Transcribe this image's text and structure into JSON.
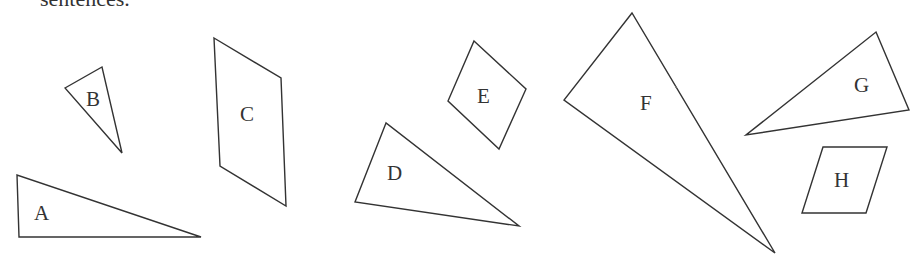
{
  "caption": "sentences.",
  "colors": {
    "stroke": "#333333",
    "text": "#333333",
    "background": "#ffffff"
  },
  "shapes": [
    {
      "id": "A",
      "label": "A",
      "kind": "triangle",
      "points": "17,175 19,237 201,237",
      "label_pos": [
        34,
        220
      ]
    },
    {
      "id": "B",
      "label": "B",
      "kind": "triangle",
      "points": "65,88 102,67 122,153",
      "label_pos": [
        86,
        106
      ]
    },
    {
      "id": "C",
      "label": "C",
      "kind": "parallelogram",
      "points": "214,38 281,78 286,206 220,166",
      "label_pos": [
        240,
        121
      ]
    },
    {
      "id": "D",
      "label": "D",
      "kind": "triangle",
      "points": "386,123 355,202 519,226",
      "label_pos": [
        387,
        180
      ]
    },
    {
      "id": "E",
      "label": "E",
      "kind": "rhombus",
      "points": "474,41 526,89 499,149 448,101",
      "label_pos": [
        477,
        103
      ]
    },
    {
      "id": "F",
      "label": "F",
      "kind": "triangle",
      "points": "632,13 564,100 775,253",
      "label_pos": [
        640,
        110
      ]
    },
    {
      "id": "G",
      "label": "G",
      "kind": "triangle",
      "points": "876,32 909,110 746,135",
      "label_pos": [
        854,
        92
      ]
    },
    {
      "id": "H",
      "label": "H",
      "kind": "parallelogram",
      "points": "823,147 887,147 866,213 802,213",
      "label_pos": [
        834,
        187
      ]
    }
  ],
  "labels": {
    "A": "A",
    "B": "B",
    "C": "C",
    "D": "D",
    "E": "E",
    "F": "F",
    "G": "G",
    "H": "H"
  }
}
